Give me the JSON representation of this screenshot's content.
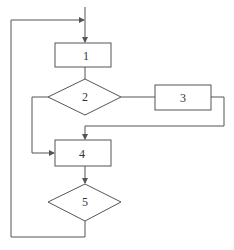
{
  "diagram": {
    "type": "flowchart",
    "nodes": [
      {
        "id": "1",
        "shape": "rectangle",
        "label": "1"
      },
      {
        "id": "2",
        "shape": "diamond",
        "label": "2"
      },
      {
        "id": "3",
        "shape": "rectangle",
        "label": "3"
      },
      {
        "id": "4",
        "shape": "rectangle",
        "label": "4"
      },
      {
        "id": "5",
        "shape": "diamond",
        "label": "5"
      }
    ],
    "edges": [
      {
        "from": "start",
        "to": "1"
      },
      {
        "from": "1",
        "to": "2"
      },
      {
        "from": "2",
        "to": "3",
        "side": "right"
      },
      {
        "from": "2",
        "to": "4",
        "side": "left"
      },
      {
        "from": "3",
        "to": "4"
      },
      {
        "from": "4",
        "to": "5"
      },
      {
        "from": "5",
        "to": "1",
        "loop": true
      }
    ],
    "colors": {
      "line": "#555555",
      "background": "#ffffff",
      "text": "#333333"
    }
  }
}
